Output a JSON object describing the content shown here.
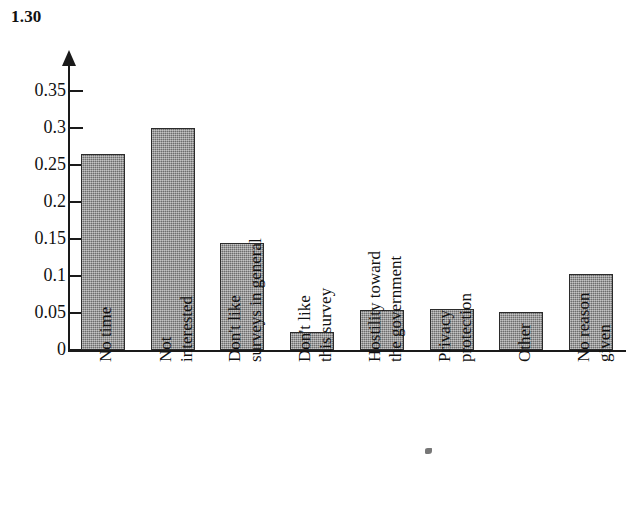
{
  "figure": {
    "number": "1.30"
  },
  "chart_data": {
    "type": "bar",
    "title": "1.30",
    "xlabel": "",
    "ylabel": "",
    "ylim": [
      0,
      0.35
    ],
    "grid": false,
    "legend": null,
    "y_ticks": [
      "0",
      "0.05",
      "0.1",
      "0.15",
      "0.2",
      "0.25",
      "0.3",
      "0.35"
    ],
    "y_tick_values": [
      0,
      0.05,
      0.1,
      0.15,
      0.2,
      0.25,
      0.3,
      0.35
    ],
    "categories": [
      "No time",
      "Not interested",
      "Don't like surveys in general",
      "Don't like this survey",
      "Hostility toward the government",
      "Privacy protection",
      "Other",
      "No reason given"
    ],
    "category_lines": [
      [
        "No time"
      ],
      [
        "Not",
        "interested"
      ],
      [
        "Don't like",
        "surveys in general"
      ],
      [
        "Don't like",
        "this survey"
      ],
      [
        "Hostility toward",
        "the government"
      ],
      [
        "Privacy",
        "protection"
      ],
      [
        "Other"
      ],
      [
        "No reason",
        "given"
      ]
    ],
    "values": [
      0.265,
      0.3,
      0.145,
      0.024,
      0.054,
      0.055,
      0.051,
      0.103
    ],
    "bar_color": "#8a8a8a",
    "bar_border_color": "#2b2b2b",
    "axis_color": "#1a1a1a"
  }
}
